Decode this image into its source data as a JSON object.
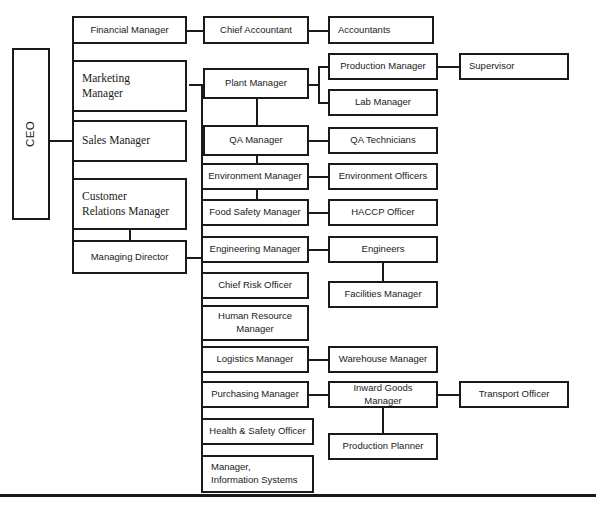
{
  "chart": {
    "type": "org-chart",
    "line_color": "#1a1a1a",
    "box_fill": "#ffffff",
    "page_background": "#ffffff",
    "bottom_rule": {
      "y": 494,
      "thickness": 3
    }
  },
  "nodes": [
    {
      "id": "ceo",
      "label": "CEO",
      "x": 12,
      "y": 48,
      "w": 38,
      "h": 172,
      "style": "vert",
      "level": 1
    },
    {
      "id": "financial-manager",
      "label": "Financial Manager",
      "x": 72,
      "y": 16,
      "w": 115,
      "h": 28,
      "style": "sans-center",
      "level": 2
    },
    {
      "id": "marketing-manager",
      "label": "Marketing\nManager",
      "x": 72,
      "y": 60,
      "w": 115,
      "h": 52,
      "style": "serif-left",
      "level": 2
    },
    {
      "id": "sales-manager",
      "label": "Sales Manager",
      "x": 72,
      "y": 120,
      "w": 115,
      "h": 42,
      "style": "serif-left",
      "level": 2
    },
    {
      "id": "customer-relations-manager",
      "label": "Customer\nRelations Manager",
      "x": 72,
      "y": 178,
      "w": 115,
      "h": 52,
      "style": "serif-left",
      "level": 2
    },
    {
      "id": "managing-director",
      "label": "Managing Director",
      "x": 72,
      "y": 240,
      "w": 115,
      "h": 34,
      "style": "sans-center",
      "level": 2
    },
    {
      "id": "chief-accountant",
      "label": "Chief Accountant",
      "x": 203,
      "y": 16,
      "w": 106,
      "h": 28,
      "style": "sans-center",
      "level": 3
    },
    {
      "id": "accountants",
      "label": "Accountants",
      "x": 328,
      "y": 16,
      "w": 106,
      "h": 28,
      "style": "sans-left",
      "level": 4
    },
    {
      "id": "plant-manager",
      "label": "Plant Manager",
      "x": 203,
      "y": 68,
      "w": 106,
      "h": 31,
      "style": "sans-center",
      "level": 3
    },
    {
      "id": "production-manager",
      "label": "Production Manager",
      "x": 328,
      "y": 53,
      "w": 110,
      "h": 27,
      "style": "sans-center",
      "level": 4
    },
    {
      "id": "supervisor",
      "label": "Supervisor",
      "x": 459,
      "y": 53,
      "w": 110,
      "h": 27,
      "style": "sans-left",
      "level": 5
    },
    {
      "id": "lab-manager",
      "label": "Lab Manager",
      "x": 328,
      "y": 89,
      "w": 110,
      "h": 27,
      "style": "sans-center",
      "level": 4
    },
    {
      "id": "qa-manager",
      "label": "QA Manager",
      "x": 203,
      "y": 125,
      "w": 106,
      "h": 31,
      "style": "sans-center",
      "level": 3
    },
    {
      "id": "qa-technicians",
      "label": "QA Technicians",
      "x": 328,
      "y": 127,
      "w": 110,
      "h": 27,
      "style": "sans-center",
      "level": 4
    },
    {
      "id": "environment-manager",
      "label": "Environment Manager",
      "x": 201,
      "y": 163,
      "w": 108,
      "h": 27,
      "style": "sans-center",
      "level": 3
    },
    {
      "id": "environment-officers",
      "label": "Environment Officers",
      "x": 328,
      "y": 163,
      "w": 110,
      "h": 27,
      "style": "sans-center",
      "level": 4
    },
    {
      "id": "food-safety-manager",
      "label": "Food Safety Manager",
      "x": 201,
      "y": 199,
      "w": 108,
      "h": 27,
      "style": "sans-center",
      "level": 3
    },
    {
      "id": "haccp-officer",
      "label": "HACCP Officer",
      "x": 328,
      "y": 199,
      "w": 110,
      "h": 27,
      "style": "sans-center",
      "level": 4
    },
    {
      "id": "engineering-manager",
      "label": "Engineering Manager",
      "x": 201,
      "y": 236,
      "w": 108,
      "h": 27,
      "style": "sans-center",
      "level": 3
    },
    {
      "id": "engineers",
      "label": "Engineers",
      "x": 328,
      "y": 236,
      "w": 110,
      "h": 27,
      "style": "sans-center",
      "level": 4
    },
    {
      "id": "facilities-manager",
      "label": "Facilities Manager",
      "x": 328,
      "y": 281,
      "w": 110,
      "h": 27,
      "style": "sans-center",
      "level": 5
    },
    {
      "id": "chief-risk-officer",
      "label": "Chief Risk Officer",
      "x": 201,
      "y": 272,
      "w": 108,
      "h": 27,
      "style": "sans-center",
      "level": 3
    },
    {
      "id": "human-resource-manager",
      "label": "Human Resource\nManager",
      "x": 201,
      "y": 305,
      "w": 108,
      "h": 36,
      "style": "sans-center",
      "level": 3
    },
    {
      "id": "logistics-manager",
      "label": "Logistics Manager",
      "x": 201,
      "y": 346,
      "w": 108,
      "h": 27,
      "style": "sans-center",
      "level": 3
    },
    {
      "id": "warehouse-manager",
      "label": "Warehouse Manager",
      "x": 328,
      "y": 346,
      "w": 110,
      "h": 27,
      "style": "sans-center",
      "level": 4
    },
    {
      "id": "purchasing-manager",
      "label": "Purchasing Manager",
      "x": 201,
      "y": 381,
      "w": 108,
      "h": 27,
      "style": "sans-center",
      "level": 3
    },
    {
      "id": "inward-goods-manager",
      "label": "Inward Goods Manager",
      "x": 328,
      "y": 381,
      "w": 110,
      "h": 27,
      "style": "sans-center",
      "level": 4
    },
    {
      "id": "transport-officer",
      "label": "Transport Officer",
      "x": 459,
      "y": 381,
      "w": 110,
      "h": 27,
      "style": "sans-center",
      "level": 5
    },
    {
      "id": "production-planner",
      "label": "Production Planner",
      "x": 328,
      "y": 433,
      "w": 110,
      "h": 27,
      "style": "sans-center",
      "level": 5
    },
    {
      "id": "health-safety-officer",
      "label": "Health & Safety Officer",
      "x": 201,
      "y": 418,
      "w": 113,
      "h": 27,
      "style": "sans-center",
      "level": 3
    },
    {
      "id": "manager-information-systems",
      "label": "Manager,\nInformation Systems",
      "x": 201,
      "y": 455,
      "w": 113,
      "h": 38,
      "style": "sans-left",
      "level": 3
    }
  ],
  "connectors": [
    {
      "id": "ceo-stem",
      "orient": "h",
      "x": 50,
      "y": 140,
      "len": 22,
      "note": "CEO right to trunk"
    },
    {
      "id": "ceo-trunk",
      "orient": "v",
      "x": 72,
      "y": 30,
      "len": 227,
      "note": "vertical trunk for level-2 boxes"
    },
    {
      "id": "ceo-to-financial",
      "orient": "h",
      "x": 72,
      "y": 30,
      "len": 0
    },
    {
      "id": "ceo-to-marketing",
      "orient": "h",
      "x": 72,
      "y": 86,
      "len": 0
    },
    {
      "id": "ceo-to-sales",
      "orient": "h",
      "x": 72,
      "y": 141,
      "len": 0
    },
    {
      "id": "ceo-to-crm",
      "orient": "h",
      "x": 72,
      "y": 204,
      "len": 0
    },
    {
      "id": "ceo-to-md",
      "orient": "h",
      "x": 72,
      "y": 257,
      "len": 0
    },
    {
      "id": "crm-to-md",
      "orient": "v",
      "x": 129,
      "y": 230,
      "len": 10
    },
    {
      "id": "financial-to-chief-acct",
      "orient": "h",
      "x": 187,
      "y": 30,
      "len": 16
    },
    {
      "id": "chief-acct-to-accts",
      "orient": "h",
      "x": 309,
      "y": 30,
      "len": 19
    },
    {
      "id": "md-to-trunk",
      "orient": "h",
      "x": 187,
      "y": 257,
      "len": 14
    },
    {
      "id": "mid-trunk",
      "orient": "v",
      "x": 201,
      "y": 84,
      "len": 390,
      "note": "Managing Director trunk serving middle column"
    },
    {
      "id": "trunk-to-plant",
      "orient": "h",
      "x": 189,
      "y": 84,
      "len": 14
    },
    {
      "id": "plant-to-qa-vert",
      "orient": "v",
      "x": 256,
      "y": 99,
      "len": 26
    },
    {
      "id": "qa-to-env-vert",
      "orient": "v",
      "x": 256,
      "y": 156,
      "len": 7
    },
    {
      "id": "env-to-food-vert",
      "orient": "v",
      "x": 256,
      "y": 190,
      "len": 9
    },
    {
      "id": "plant-to-bracket",
      "orient": "h",
      "x": 309,
      "y": 84,
      "len": 10
    },
    {
      "id": "prod-lab-bracket",
      "orient": "v",
      "x": 318,
      "y": 66,
      "len": 37
    },
    {
      "id": "bracket-to-production",
      "orient": "h",
      "x": 318,
      "y": 66,
      "len": 10
    },
    {
      "id": "bracket-to-lab",
      "orient": "h",
      "x": 318,
      "y": 102,
      "len": 10
    },
    {
      "id": "production-to-supervisor",
      "orient": "h",
      "x": 438,
      "y": 66,
      "len": 21
    },
    {
      "id": "qa-to-qatech",
      "orient": "h",
      "x": 309,
      "y": 140,
      "len": 19
    },
    {
      "id": "env-to-envoff",
      "orient": "h",
      "x": 309,
      "y": 176,
      "len": 19
    },
    {
      "id": "food-to-haccp",
      "orient": "h",
      "x": 309,
      "y": 212,
      "len": 19
    },
    {
      "id": "eng-to-engineers",
      "orient": "h",
      "x": 309,
      "y": 249,
      "len": 19
    },
    {
      "id": "engineers-to-facilities",
      "orient": "v",
      "x": 382,
      "y": 263,
      "len": 18
    },
    {
      "id": "log-to-warehouse",
      "orient": "h",
      "x": 309,
      "y": 359,
      "len": 19
    },
    {
      "id": "pur-to-inward",
      "orient": "h",
      "x": 309,
      "y": 394,
      "len": 19
    },
    {
      "id": "inward-to-transport",
      "orient": "h",
      "x": 438,
      "y": 394,
      "len": 21
    },
    {
      "id": "inward-to-planner",
      "orient": "v",
      "x": 382,
      "y": 408,
      "len": 25
    }
  ],
  "branch_stubs": [
    {
      "id": "stub-qa-manager",
      "y": 140
    },
    {
      "id": "stub-environment",
      "y": 176
    },
    {
      "id": "stub-food-safety",
      "y": 212
    },
    {
      "id": "stub-engineering",
      "y": 249
    },
    {
      "id": "stub-chief-risk",
      "y": 285
    },
    {
      "id": "stub-hr",
      "y": 323
    },
    {
      "id": "stub-logistics",
      "y": 359
    },
    {
      "id": "stub-purchasing",
      "y": 394
    },
    {
      "id": "stub-health-safety",
      "y": 431
    },
    {
      "id": "stub-info-systems",
      "y": 474
    }
  ]
}
